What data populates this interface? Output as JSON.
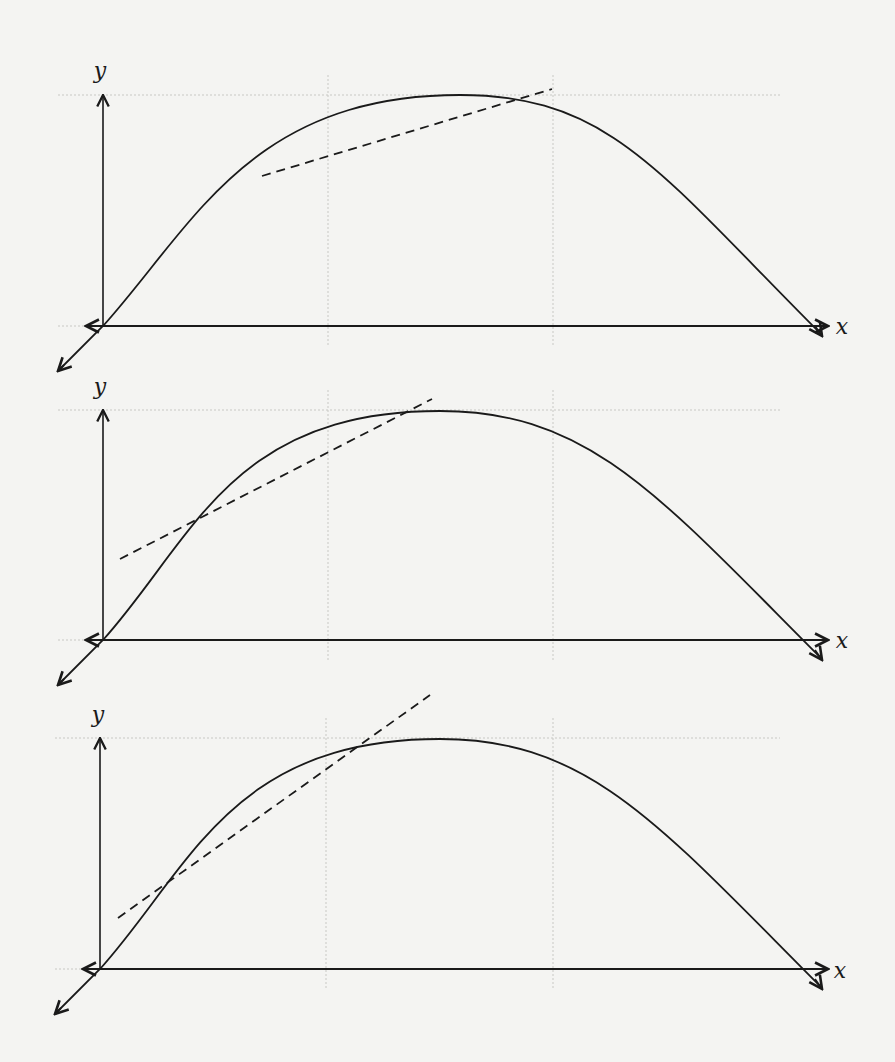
{
  "figure": {
    "colors": {
      "background": "#f4f4f2",
      "ink": "#1a1a1a",
      "grid": "#c8c8c4"
    },
    "panels": [
      {
        "id": "panel-1",
        "x_label": "x",
        "y_label": "y",
        "origin": [
          103,
          326
        ],
        "y_top": 95,
        "x_end": 828,
        "peak": [
          460,
          95
        ],
        "curve_end": [
          820,
          333
        ],
        "secant": {
          "from": [
            262,
            176
          ],
          "to": [
            552,
            89
          ],
          "style": "dashed"
        },
        "grid_x": [
          328,
          553
        ],
        "grid_y": 95,
        "y_label_pos": [
          100,
          78
        ],
        "x_label_pos": [
          842,
          334
        ]
      },
      {
        "id": "panel-2",
        "x_label": "x",
        "y_label": "y",
        "origin": [
          103,
          640
        ],
        "y_top": 410,
        "x_end": 828,
        "peak": [
          440,
          411
        ],
        "curve_end": [
          820,
          657
        ],
        "secant": {
          "from": [
            120,
            559
          ],
          "to": [
            432,
            399
          ],
          "style": "dashed"
        },
        "grid_x": [
          328,
          553
        ],
        "grid_y": 410,
        "y_label_pos": [
          100,
          394
        ],
        "x_label_pos": [
          842,
          648
        ]
      },
      {
        "id": "panel-3",
        "x_label": "x",
        "y_label": "y",
        "origin": [
          100,
          969
        ],
        "y_top": 738,
        "x_end": 828,
        "peak": [
          440,
          739
        ],
        "curve_end": [
          820,
          986
        ],
        "secant": {
          "from": [
            118,
            918
          ],
          "to": [
            430,
            695
          ],
          "style": "dashed"
        },
        "grid_x": [
          326,
          553
        ],
        "grid_y": 738,
        "y_label_pos": [
          98,
          722
        ],
        "x_label_pos": [
          840,
          978
        ]
      }
    ]
  },
  "chart_data": [
    {
      "type": "line",
      "title": "",
      "xlabel": "x",
      "ylabel": "y",
      "series": [
        {
          "name": "curve",
          "shape": "concave-down arc through origin, peak near middle, returns to x-axis at right"
        },
        {
          "name": "secant (dashed)",
          "shape": "shallow slope, crosses curve at two well-separated points"
        }
      ],
      "grid": true
    },
    {
      "type": "line",
      "title": "",
      "xlabel": "x",
      "ylabel": "y",
      "series": [
        {
          "name": "curve",
          "shape": "concave-down arc"
        },
        {
          "name": "secant (dashed)",
          "shape": "steeper slope, intersection points closer together"
        }
      ],
      "grid": true
    },
    {
      "type": "line",
      "title": "",
      "xlabel": "x",
      "ylabel": "y",
      "series": [
        {
          "name": "curve",
          "shape": "concave-down arc"
        },
        {
          "name": "secant (dashed)",
          "shape": "nearly tangent line near the lower-left portion of the curve"
        }
      ],
      "grid": true
    }
  ]
}
